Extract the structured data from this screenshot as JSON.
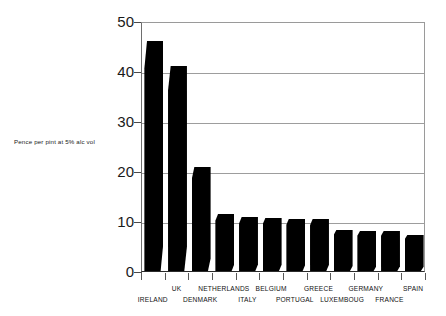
{
  "caption": {
    "y_description": "Pence per pint at 5% alc vol"
  },
  "chart_data": {
    "type": "bar",
    "title": "",
    "subtitle": "",
    "xlabel": "",
    "ylabel": "Pence per pint at 5% alc vol",
    "ylim": [
      0,
      50
    ],
    "yticks": [
      0,
      10,
      20,
      30,
      40,
      50
    ],
    "ytick_labels": [
      "0",
      "10",
      "20",
      "30",
      "40",
      "50"
    ],
    "grid": true,
    "legend": "none",
    "bar_color": "#000000",
    "categories": [
      "IRELAND",
      "UK",
      "DENMARK",
      "NETHERLANDS",
      "ITALY",
      "BELGIUM",
      "PORTUGAL",
      "GREECE",
      "LUXEMBOUG",
      "GERMANY",
      "FRANCE",
      "SPAIN"
    ],
    "values": [
      46,
      41,
      20.8,
      11.4,
      10.8,
      10.6,
      10.5,
      10.4,
      8.2,
      8.0,
      8.0,
      7.2
    ]
  }
}
